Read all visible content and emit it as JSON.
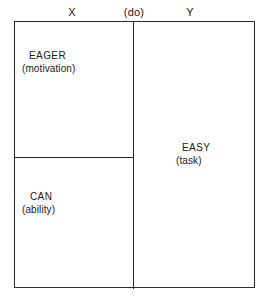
{
  "diagram": {
    "type": "partitioned-box-diagram",
    "top_labels": [
      {
        "id": "x",
        "text": "X"
      },
      {
        "id": "do",
        "text": "(do)"
      },
      {
        "id": "y",
        "text": "Y"
      }
    ],
    "cells": [
      {
        "id": "eager",
        "title": "EAGER",
        "subtitle": "(motivation)",
        "position": "upper-left"
      },
      {
        "id": "can",
        "title": "CAN",
        "subtitle": "(ability)",
        "position": "lower-left"
      },
      {
        "id": "easy",
        "title": "EASY",
        "subtitle": "(task)",
        "position": "right"
      }
    ],
    "colors": {
      "background": "#ffffff",
      "line": "#2b2b2b",
      "text": "#1a1a1a"
    }
  }
}
